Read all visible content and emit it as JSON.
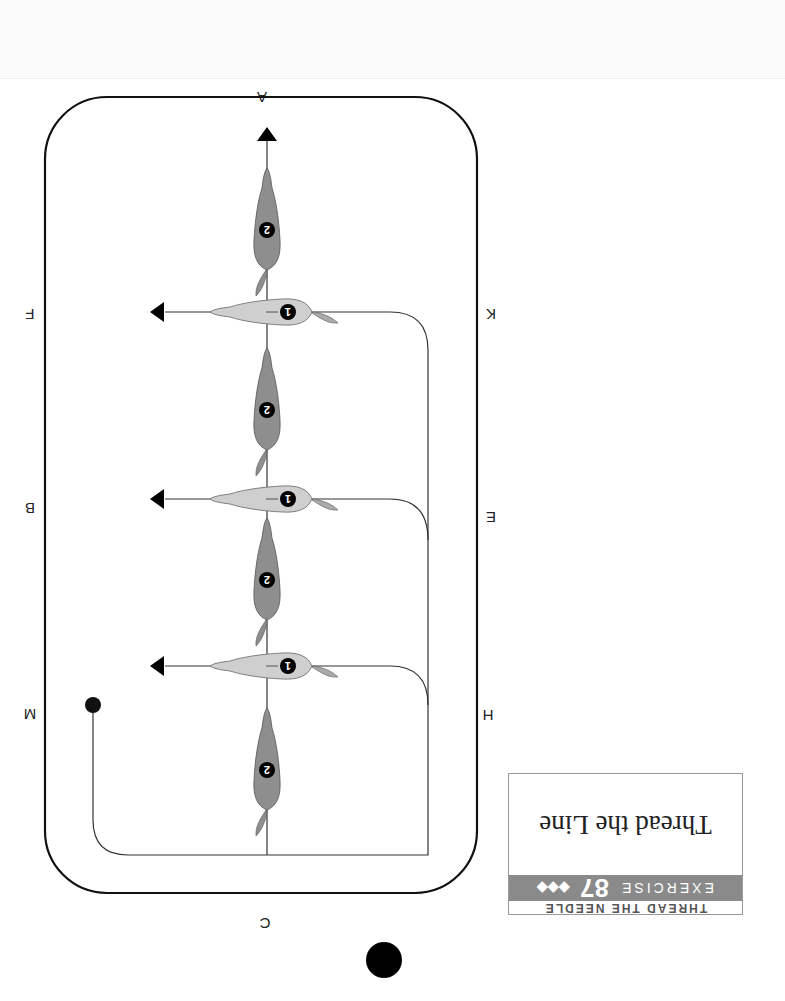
{
  "exercise": {
    "category": "THREAD THE NEEDLE",
    "label": "EXERCISE",
    "number": "87",
    "difficulty": "◆◆◆",
    "title": "Thread the Line"
  },
  "arena": {
    "letters": {
      "top": "A",
      "bottom": "C",
      "left": [
        "F",
        "B",
        "M"
      ],
      "right": [
        "K",
        "E",
        "H"
      ]
    }
  },
  "horses": {
    "horse1_label": "1",
    "horse2_label": "2",
    "horse1_color": "#c8c8c8",
    "horse2_color": "#8e8e8e"
  },
  "orientation": "rotated 180 degrees"
}
